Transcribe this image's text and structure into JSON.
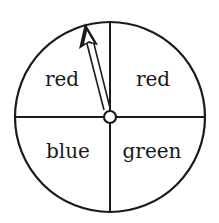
{
  "diagram": {
    "type": "spinner",
    "sections": [
      {
        "position": "top-left",
        "label": "red"
      },
      {
        "position": "top-right",
        "label": "red"
      },
      {
        "position": "bottom-left",
        "label": "blue"
      },
      {
        "position": "bottom-right",
        "label": "green"
      }
    ],
    "pointer": {
      "points_to": "top-left",
      "section_label": "red"
    },
    "colors": {
      "stroke": "#1a1a1a",
      "background": "#ffffff"
    }
  }
}
